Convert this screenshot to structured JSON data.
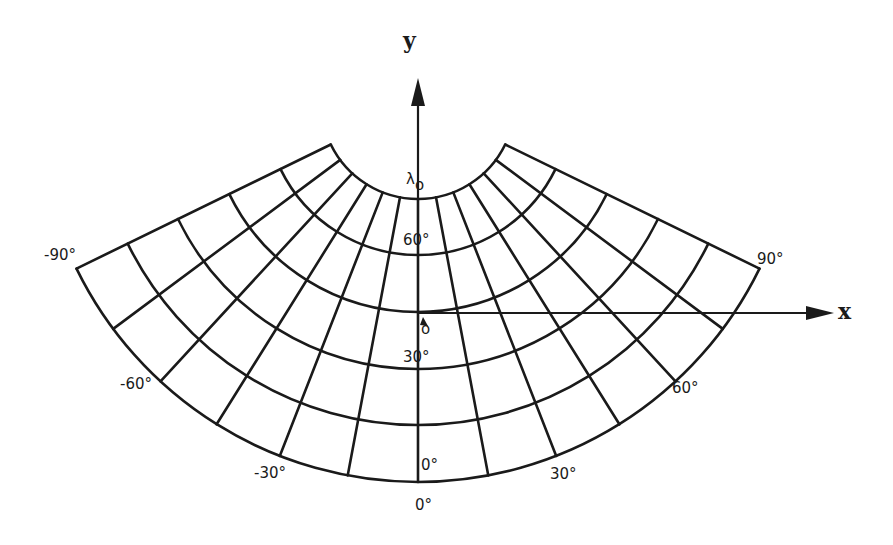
{
  "figure": {
    "type": "conic-projection-graticule",
    "axes": {
      "x_label": "x",
      "y_label": "y"
    },
    "symbols": {
      "lambda0": "λ",
      "lambda0_sub": "o",
      "phi0": "φ",
      "phi0_sub": "o"
    },
    "longitude_labels": {
      "minus90": "-90°",
      "plus90": "90°",
      "minus60": "-60°",
      "plus60": "60°",
      "minus30": "-30°",
      "plus30": "30°",
      "zero_bottom": "0°"
    },
    "latitude_labels": {
      "lat60": "60°",
      "lat30": "30°",
      "lat0": "0°"
    },
    "graticule": {
      "meridians_deg": [
        -90,
        -75,
        -60,
        -45,
        -30,
        -15,
        0,
        15,
        30,
        45,
        60,
        75,
        90
      ],
      "parallel_count": 6,
      "apex": [
        418,
        102
      ],
      "radii": [
        97,
        153,
        210,
        267,
        323,
        380
      ],
      "half_angle_deg": 64
    },
    "colors": {
      "ink": "#1a1a1a",
      "background": "#ffffff"
    }
  }
}
